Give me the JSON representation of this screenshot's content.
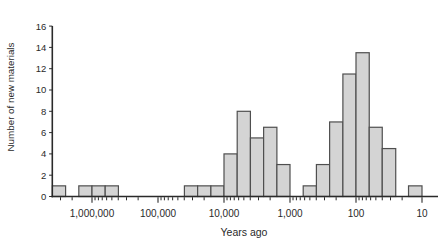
{
  "chart_data": {
    "type": "bar",
    "subtype": "histogram",
    "title": "",
    "xlabel": "Years ago",
    "ylabel": "Number of new materials",
    "x_scale": "logarithmic, reversed (oldest at left, ~4,000,000 down to 10)",
    "x_tick_labels": [
      "1,000,000",
      "100,000",
      "10,000",
      "1,000",
      "100",
      "10"
    ],
    "x_tick_values": [
      1000000,
      100000,
      10000,
      1000,
      100,
      10
    ],
    "y_tick_labels": [
      "0",
      "2",
      "4",
      "6",
      "8",
      "10",
      "12",
      "14",
      "16"
    ],
    "y_tick_values": [
      0,
      2,
      4,
      6,
      8,
      10,
      12,
      14,
      16
    ],
    "ylim": [
      0,
      16
    ],
    "grid": "off",
    "legend": "none",
    "bin_edges_years_ago": [
      3981000,
      2512000,
      1585000,
      1000000,
      631000,
      398000,
      251000,
      158000,
      100000,
      63100,
      39800,
      25100,
      15800,
      10000,
      6310,
      3980,
      2510,
      1580,
      1000,
      631,
      398,
      251,
      158,
      100,
      63,
      40,
      25,
      16,
      10
    ],
    "counts": [
      1,
      0,
      1,
      1,
      1,
      0,
      0,
      0,
      0,
      0,
      1,
      1,
      1,
      4,
      8,
      5.5,
      6.5,
      3,
      0,
      1,
      3,
      7,
      11.5,
      13.5,
      6.5,
      4.5,
      0,
      1
    ]
  },
  "colors": {
    "background": "#ffffff",
    "bar_fill": "#d4d4d4",
    "bar_stroke": "#4f4f4f",
    "axis": "#2a2a2a",
    "text": "#2a2a2a"
  }
}
